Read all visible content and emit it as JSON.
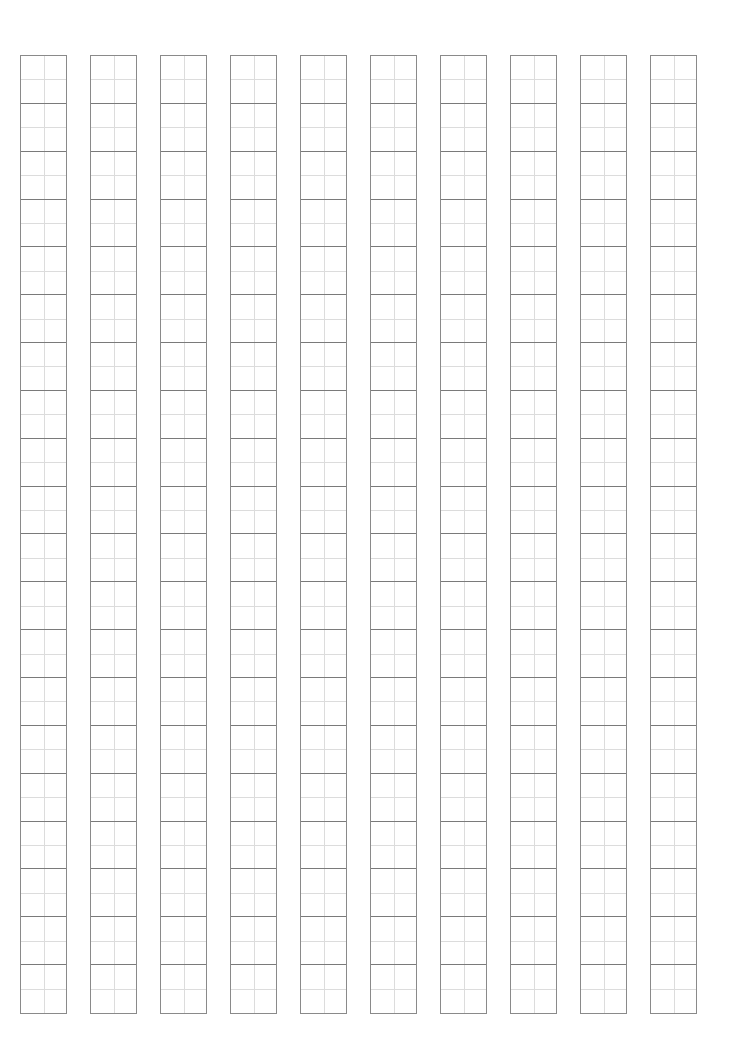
{
  "sheet": {
    "type": "practice-grid-paper",
    "columns": 10,
    "rows_per_column": 20,
    "column_left_positions_px": [
      20,
      90,
      160,
      230,
      300,
      370,
      440,
      510,
      580,
      650
    ],
    "grid_top_px": 55,
    "grid_bottom_px": 1014,
    "cell_width_px": 47,
    "cell_height_px": 48,
    "colors": {
      "background": "#ffffff",
      "cell_border": "#8a8a8a",
      "guide_line": "#dcdcdc"
    }
  }
}
